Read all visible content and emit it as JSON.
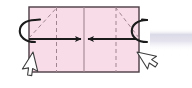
{
  "figure": {
    "kind": "origami-fold-step-diagram",
    "title": "Fold both sides in to the center line",
    "canvas": {
      "width": 192,
      "height": 88,
      "background": "#ffffff"
    }
  },
  "colors": {
    "paper_fill": "#f8dde9",
    "paper_stroke": "#4a3b42",
    "fold_line": "#a08490",
    "arrow": "#1b1b1b",
    "cursor_fill": "#ffffff",
    "cursor_stroke": "#3d3d3d",
    "artifact_band": "#dcdce4"
  },
  "paper": {
    "label": "paper-sheet",
    "x": 29,
    "y": 7,
    "width": 110,
    "height": 65,
    "fill": "#f8dde9",
    "stroke": "#4a3b42",
    "stroke_width": 1.4
  },
  "center_line": {
    "label": "center-crease",
    "style": "solid",
    "x": 84,
    "y1": 7,
    "y2": 72,
    "color": "#a08490"
  },
  "fold_lines": [
    {
      "name": "left-vertical-fold-line",
      "style": "dashed",
      "orientation": "vertical",
      "x": 56.5,
      "y1": 7,
      "y2": 72,
      "dash": "4,3"
    },
    {
      "name": "right-vertical-fold-line",
      "style": "dashed",
      "orientation": "vertical",
      "x": 116,
      "y1": 7,
      "y2": 72,
      "dash": "4,3"
    },
    {
      "name": "left-diagonal-fold-line",
      "style": "dashed",
      "orientation": "diagonal",
      "x1": 29,
      "y1": 38,
      "x2": 56.5,
      "y2": 8,
      "dash": "4,3"
    },
    {
      "name": "right-diagonal-fold-line",
      "style": "dashed",
      "orientation": "diagonal",
      "x1": 139,
      "y1": 38,
      "x2": 116,
      "y2": 8,
      "dash": "4,3"
    }
  ],
  "arrows": [
    {
      "name": "left-inward-fold-arrow",
      "direction": "right",
      "from_x": 29,
      "to_x": 81,
      "y": 39,
      "color": "#1b1b1b"
    },
    {
      "name": "right-inward-fold-arrow",
      "direction": "left",
      "from_x": 136,
      "to_x": 88,
      "y": 39,
      "color": "#1b1b1b"
    }
  ],
  "wrap_loops": [
    {
      "name": "left-edge-wrap-loop",
      "center_x": 28,
      "center_y": 31,
      "rx": 7,
      "ry": 11,
      "color": "#1b1b1b"
    },
    {
      "name": "right-edge-wrap-loop",
      "center_x": 140,
      "center_y": 31,
      "rx": 7,
      "ry": 11,
      "color": "#1b1b1b"
    }
  ],
  "cursors": [
    {
      "name": "left-hand-pointer-cursor",
      "tip_x": 33,
      "tip_y": 52,
      "rotation_deg": 32,
      "fill": "#ffffff",
      "stroke": "#3d3d3d"
    },
    {
      "name": "right-hand-pointer-cursor",
      "tip_x": 137,
      "tip_y": 52,
      "rotation_deg": -32,
      "fill": "#ffffff",
      "stroke": "#3d3d3d"
    }
  ],
  "artifact_band": {
    "name": "compression-artifact-band",
    "x": 150,
    "y": 29,
    "width": 42,
    "height": 22,
    "color": "#dcdce4"
  },
  "alt_text": "Origami diagram: a pink rectangle with a solid center crease, dashed fold lines, two arrows pointing inward toward the center, curved wrap arrows around the left and right edges, and two white hand cursors at the lower corners."
}
